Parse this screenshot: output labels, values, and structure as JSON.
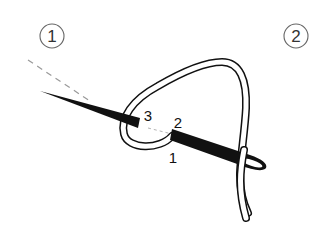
{
  "diagram": {
    "step_markers": [
      {
        "id": "step-1",
        "label": "1",
        "x": 52,
        "y": 37
      },
      {
        "id": "step-2",
        "label": "2",
        "x": 296,
        "y": 37
      }
    ],
    "point_labels": [
      {
        "id": "point-3",
        "label": "3",
        "x": 148,
        "y": 121
      },
      {
        "id": "point-2",
        "label": "2",
        "x": 178,
        "y": 128
      },
      {
        "id": "point-1",
        "label": "1",
        "x": 173,
        "y": 163
      }
    ],
    "colors": {
      "ink": "#111111",
      "marker_stroke": "#666666",
      "dashed_line": "#999999",
      "background": "#ffffff"
    }
  }
}
